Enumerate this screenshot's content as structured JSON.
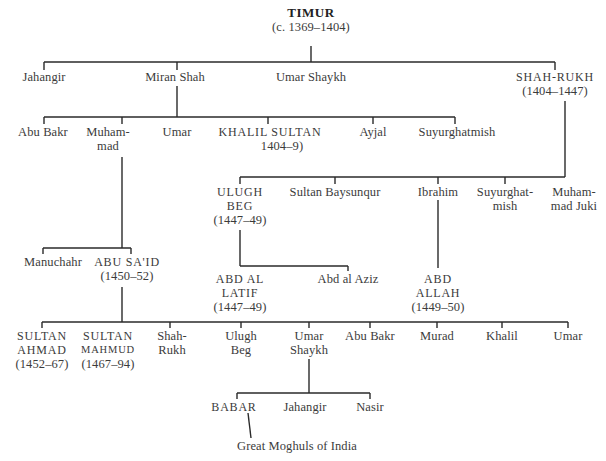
{
  "diagram": {
    "root": {
      "name": "TIMUR",
      "dates": "(c. 1369–1404)"
    },
    "generation1": [
      {
        "name": "Jahangir"
      },
      {
        "name": "Miran Shah"
      },
      {
        "name": "Umar Shaykh"
      },
      {
        "name": "SHAH-RUKH",
        "dates": "(1404–1447)"
      }
    ],
    "miran_shah_children": [
      {
        "name": "Abu Bakr"
      },
      {
        "name": "Muham-",
        "name2": "mad"
      },
      {
        "name": "Umar"
      },
      {
        "name": "KHALIL SULTAN",
        "dates": "1404–9)"
      },
      {
        "name": "Ayjal"
      },
      {
        "name": "Suyurghatmish"
      }
    ],
    "shah_rukh_children": [
      {
        "name": "ULUGH",
        "name2": "BEG",
        "dates": "(1447–49)"
      },
      {
        "name": "Sultan Baysunqur"
      },
      {
        "name": "Ibrahim"
      },
      {
        "name": "Suyurghat-",
        "name2": "mish"
      },
      {
        "name": "Muham-",
        "name2": "mad Juki"
      }
    ],
    "muhammad_children": [
      {
        "name": "Manuchahr"
      },
      {
        "name": "ABU SA'ID",
        "dates": "(1450–52)"
      }
    ],
    "ulugh_beg_children": [
      {
        "name": "ABD AL",
        "name2": "LATIF",
        "dates": "(1447–49)"
      },
      {
        "name": "Abd al Aziz"
      }
    ],
    "ibrahim_children": [
      {
        "name": "ABD",
        "name2": "ALLAH",
        "dates": "(1449–50)"
      }
    ],
    "abu_said_children": [
      {
        "name": "SULTAN",
        "name2": "AHMAD",
        "dates": "(1452–67)"
      },
      {
        "name": "SULTAN",
        "name2": "MAHMUD",
        "dates": "(1467–94)"
      },
      {
        "name": "Shah-",
        "name2": "Rukh"
      },
      {
        "name": "Ulugh",
        "name2": "Beg"
      },
      {
        "name": "Umar",
        "name2": "Shaykh"
      },
      {
        "name": "Abu Bakr"
      },
      {
        "name": "Murad"
      },
      {
        "name": "Khalil"
      },
      {
        "name": "Umar"
      }
    ],
    "umar_shaykh_children": [
      {
        "name": "BABAR"
      },
      {
        "name": "Jahangir"
      },
      {
        "name": "Nasir"
      }
    ],
    "babar_descendants": {
      "name": "Great Moghuls of India"
    },
    "line_color": "#2a2a2a"
  }
}
